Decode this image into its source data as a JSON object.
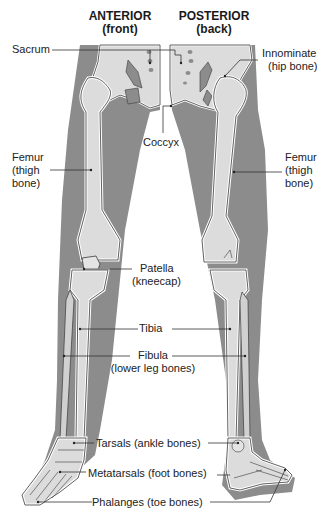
{
  "headings": {
    "anterior": {
      "title": "ANTERIOR",
      "subtitle": "(front)"
    },
    "posterior": {
      "title": "POSTERIOR",
      "subtitle": "(back)"
    }
  },
  "labels": {
    "sacrum": "Sacrum",
    "innominate": {
      "line1": "Innominate",
      "line2": "(hip bone)"
    },
    "coccyx": "Coccyx",
    "femur_left": {
      "line1": "Femur",
      "line2": "(thigh",
      "line3": "bone)"
    },
    "femur_right": {
      "line1": "Femur",
      "line2": "(thigh",
      "line3": "bone)"
    },
    "patella": {
      "line1": "Patella",
      "line2": "(kneecap)"
    },
    "tibia": "Tibia",
    "fibula": {
      "line1": "Fibula",
      "line2": "(lower leg bones)"
    },
    "tarsals": "Tarsals (ankle bones)",
    "metatarsals": "Metatarsals (foot bones)",
    "phalanges": "Phalanges (toe bones)"
  },
  "colors": {
    "flesh": "#8c8c8c",
    "bone": "#dcdcdc",
    "bone_outline": "#3a3a3a",
    "halo": "#ffffff",
    "leader": "#333333"
  }
}
